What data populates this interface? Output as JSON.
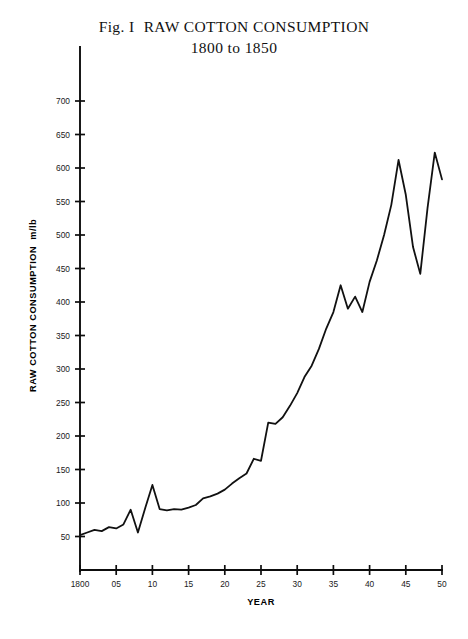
{
  "figure": {
    "title_label": "Fig. I",
    "title_main": "RAW COTTON CONSUMPTION",
    "subtitle": "1800 to 1850"
  },
  "chart_data": {
    "type": "line",
    "subtitle": "1800 to 1850",
    "xlabel": "YEAR",
    "ylabel": "RAW COTTON CONSUMPTION",
    "yunits": "m/lb",
    "xlim": [
      1800,
      1850
    ],
    "ylim": [
      0,
      730
    ],
    "grid": false,
    "legend": null,
    "line_color": "#111111",
    "x_tick_labels": [
      "1800",
      "05",
      "10",
      "15",
      "20",
      "25",
      "30",
      "35",
      "40",
      "45",
      "50"
    ],
    "x_tick_values": [
      1800,
      1805,
      1810,
      1815,
      1820,
      1825,
      1830,
      1835,
      1840,
      1845,
      1850
    ],
    "y_tick_labels": [
      "50",
      "100",
      "150",
      "200",
      "250",
      "300",
      "350",
      "400",
      "450",
      "500",
      "550",
      "600",
      "650",
      "700"
    ],
    "y_tick_values": [
      50,
      100,
      150,
      200,
      250,
      300,
      350,
      400,
      450,
      500,
      550,
      600,
      650,
      700
    ],
    "x": [
      1800,
      1801,
      1802,
      1803,
      1804,
      1805,
      1806,
      1807,
      1808,
      1809,
      1810,
      1811,
      1812,
      1813,
      1814,
      1815,
      1816,
      1817,
      1818,
      1819,
      1820,
      1821,
      1822,
      1823,
      1824,
      1825,
      1826,
      1827,
      1828,
      1829,
      1830,
      1831,
      1832,
      1833,
      1834,
      1835,
      1836,
      1837,
      1838,
      1839,
      1840,
      1841,
      1842,
      1843,
      1844,
      1845,
      1846,
      1847,
      1848,
      1849,
      1850
    ],
    "values": [
      52,
      56,
      60,
      58,
      64,
      62,
      68,
      90,
      56,
      92,
      127,
      91,
      89,
      91,
      90,
      93,
      97,
      107,
      110,
      114,
      120,
      129,
      137,
      144,
      166,
      163,
      220,
      218,
      228,
      245,
      264,
      288,
      305,
      330,
      360,
      385,
      425,
      390,
      408,
      385,
      430,
      462,
      500,
      545,
      612,
      560,
      482,
      442,
      540,
      623,
      583
    ]
  }
}
